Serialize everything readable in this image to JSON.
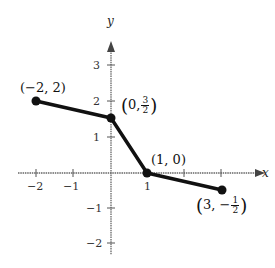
{
  "axes": {
    "x_label": "x",
    "y_label": "y",
    "x_ticks": [
      "−2",
      "−1",
      "1"
    ],
    "y_ticks": [
      "3",
      "2",
      "1",
      "−1",
      "−2"
    ]
  },
  "points": [
    {
      "label": "(−2, 2)",
      "x": -2,
      "y": 2
    },
    {
      "label_pre": "0,",
      "num": "3",
      "den": "2",
      "x": 0,
      "y": 1.5
    },
    {
      "label": "(1, 0)",
      "x": 1,
      "y": 0
    },
    {
      "label_pre": "3, −",
      "num": "1",
      "den": "2",
      "x": 3,
      "y": -0.5
    }
  ],
  "colors": {
    "line": "#111111",
    "axis": "#555555"
  }
}
